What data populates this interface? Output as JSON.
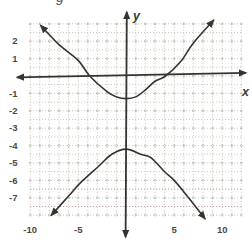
{
  "figure": {
    "clipped_title_fragment": "g"
  },
  "chart_data": {
    "type": "line",
    "title": "",
    "subtitle": "Graph of a hyperbola with vertical transverse axis, upper branch vertex near (0,-1.3) and lower branch vertex near (0,-4.2), plotted on a dotted grid",
    "xlabel": "x",
    "ylabel": "y",
    "grid": true,
    "legend": "none",
    "xlim": [
      -10.3,
      12.4
    ],
    "ylim": [
      -8.4,
      3.1
    ],
    "x_tick_labels": [
      "-10",
      "-5",
      "5",
      "10"
    ],
    "x_tick_values": [
      -10,
      -5,
      5,
      10
    ],
    "y_tick_labels": [
      "2",
      "1",
      "-1",
      "-2",
      "-3",
      "-4",
      "-5",
      "-6",
      "-7"
    ],
    "y_tick_values": [
      2,
      1,
      -1,
      -2,
      -3,
      -4,
      -5,
      -6,
      -7
    ],
    "x_grid": {
      "min": -10,
      "max": 12,
      "step": 1
    },
    "y_grid": {
      "min": -8,
      "max": 3,
      "step": 0.5
    },
    "series": [
      {
        "name": "hyperbola-upper-branch",
        "arrow_start": true,
        "arrow_end": true,
        "points": [
          [
            -8.9,
            2.9
          ],
          [
            -7,
            1.8
          ],
          [
            -5,
            0.9
          ],
          [
            -3.8,
            0
          ],
          [
            -2,
            -0.9
          ],
          [
            -1,
            -1.2
          ],
          [
            0,
            -1.3
          ],
          [
            1,
            -1.2
          ],
          [
            2,
            -0.8
          ],
          [
            3,
            -0.3
          ],
          [
            4.1,
            0
          ],
          [
            5.7,
            0.85
          ],
          [
            7,
            1.9
          ],
          [
            9.1,
            3.2
          ]
        ]
      },
      {
        "name": "hyperbola-lower-branch",
        "arrow_start": true,
        "arrow_end": true,
        "points": [
          [
            -7.8,
            -8.0
          ],
          [
            -6,
            -6.9
          ],
          [
            -4.7,
            -6.1
          ],
          [
            -2.9,
            -5.2
          ],
          [
            -1.5,
            -4.5
          ],
          [
            0,
            -4.2
          ],
          [
            1.5,
            -4.5
          ],
          [
            2.6,
            -4.7
          ],
          [
            4,
            -5.5
          ],
          [
            5,
            -6.0
          ],
          [
            6.5,
            -7.0
          ],
          [
            8.2,
            -8.2
          ]
        ]
      }
    ],
    "scan_tint_rows": [
      {
        "y": -6.5,
        "color": "#7fc0a2"
      },
      {
        "y": -7.5,
        "color": "#bf93a4"
      }
    ],
    "colors": {
      "axis": "#35342f",
      "curve": "#35342f",
      "grid": "#a29e8f",
      "grid_circle": "#aaa699",
      "tick_label": "#4b4a43",
      "background": "#ffffff"
    }
  }
}
